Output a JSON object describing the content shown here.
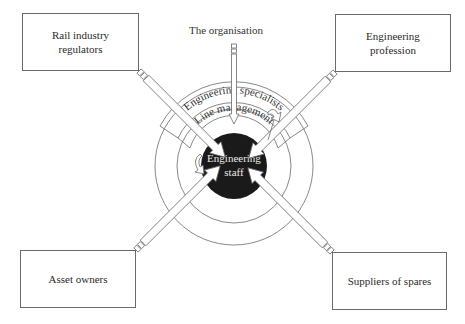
{
  "diagram": {
    "org_label": "The organisation",
    "center": {
      "line1": "Engineering",
      "line2": "staff"
    },
    "bands": {
      "outer": "Engineering specialists",
      "inner": "Line management"
    },
    "boxes": {
      "top_left": {
        "line1": "Rail industry",
        "line2": "regulators"
      },
      "top_right": {
        "line1": "Engineering",
        "line2": "profession"
      },
      "bottom_left": {
        "line1": "Asset owners"
      },
      "bottom_right": {
        "line1": "Suppliers of spares"
      }
    },
    "colors": {
      "line": "#6a6a6a",
      "core": "#1a1a1a",
      "core_text": "#e8e8e8"
    }
  }
}
